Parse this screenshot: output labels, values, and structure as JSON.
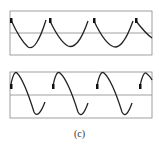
{
  "figure": {
    "caption": "(c)",
    "panels": [
      {
        "id": "top",
        "box": [
          10,
          11,
          152,
          55
        ],
        "midline_y": 33,
        "waveform": "sine-falling-start",
        "cycles": 4,
        "markers": "square-at-cycle-start"
      },
      {
        "id": "bottom",
        "box": [
          10,
          72,
          152,
          118
        ],
        "midline_y": 95,
        "waveform": "sine-rising-start",
        "cycles": 4,
        "markers": "square-at-cycle-start"
      }
    ],
    "stroke_color": "#222222",
    "frame_color": "#888888"
  }
}
